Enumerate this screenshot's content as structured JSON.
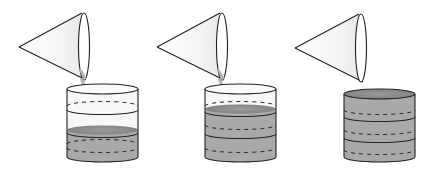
{
  "diagram": {
    "type": "sequence-illustration",
    "colors": {
      "outline": "#222222",
      "liquid": "#a9a9a9",
      "liquid_surface": "#8f8f8f",
      "cone_fill": "#f4f4f4",
      "cup_empty": "#f7f7f7",
      "stream": "#b8b8b8"
    },
    "stages": [
      {
        "label": "stage-1",
        "filled_thirds": 1,
        "pouring": true
      },
      {
        "label": "stage-2",
        "filled_thirds": 2,
        "pouring": true
      },
      {
        "label": "stage-3",
        "filled_thirds": 3,
        "pouring": false
      }
    ]
  }
}
